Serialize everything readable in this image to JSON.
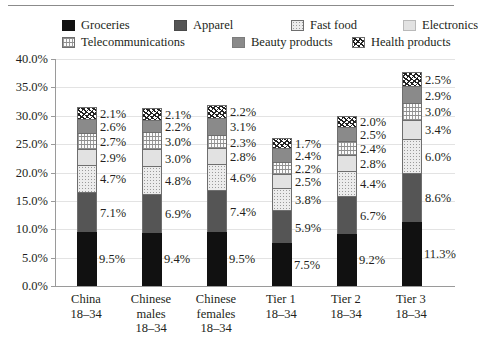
{
  "chart_data": {
    "type": "bar",
    "stacked": true,
    "title": "",
    "xlabel": "",
    "ylabel": "",
    "ylim": [
      0,
      40
    ],
    "ytick_labels": [
      "0.0%",
      "5.0%",
      "10.0%",
      "15.0%",
      "20.0%",
      "25.0%",
      "30.0%",
      "35.0%",
      "40.0%"
    ],
    "ytick_values": [
      0,
      5,
      10,
      15,
      20,
      25,
      30,
      35,
      40
    ],
    "grid": true,
    "legend_position": "top",
    "value_label_suffix": "%",
    "categories": [
      {
        "line1": "China",
        "line2": "18–34",
        "line3": ""
      },
      {
        "line1": "Chinese",
        "line2": "males",
        "line3": "18–34"
      },
      {
        "line1": "Chinese",
        "line2": "females",
        "line3": "18–34"
      },
      {
        "line1": "Tier 1",
        "line2": "18–34",
        "line3": ""
      },
      {
        "line1": "Tier 2",
        "line2": "18–34",
        "line3": ""
      },
      {
        "line1": "Tier 3",
        "line2": "18–34",
        "line3": ""
      }
    ],
    "series": [
      {
        "name": "Groceries",
        "swatch": "groceries",
        "values": [
          9.5,
          9.4,
          9.5,
          7.5,
          9.2,
          11.3
        ],
        "labels": [
          "9.5%",
          "9.4%",
          "9.5%",
          "7.5%",
          "9.2%",
          "11.3%"
        ]
      },
      {
        "name": "Apparel",
        "swatch": "apparel",
        "values": [
          7.1,
          6.9,
          7.4,
          5.9,
          6.7,
          8.6
        ],
        "labels": [
          "7.1%",
          "6.9%",
          "7.4%",
          "5.9%",
          "6.7%",
          "8.6%"
        ]
      },
      {
        "name": "Fast food",
        "swatch": "fastfood",
        "values": [
          4.7,
          4.8,
          4.6,
          3.8,
          4.4,
          6.0
        ],
        "labels": [
          "4.7%",
          "4.8%",
          "4.6%",
          "3.8%",
          "4.4%",
          "6.0%"
        ]
      },
      {
        "name": "Electronics",
        "swatch": "electronics",
        "values": [
          2.9,
          3.0,
          2.8,
          2.5,
          2.8,
          3.4
        ],
        "labels": [
          "2.9%",
          "3.0%",
          "2.8%",
          "2.5%",
          "2.8%",
          "3.4%"
        ]
      },
      {
        "name": "Telecommunications",
        "swatch": "telecom",
        "values": [
          2.7,
          3.0,
          2.3,
          2.2,
          2.4,
          3.0
        ],
        "labels": [
          "2.7%",
          "3.0%",
          "2.3%",
          "2.2%",
          "2.4%",
          "3.0%"
        ]
      },
      {
        "name": "Beauty products",
        "swatch": "beauty",
        "values": [
          2.6,
          2.2,
          3.1,
          2.4,
          2.5,
          2.9
        ],
        "labels": [
          "2.6%",
          "2.2%",
          "3.1%",
          "2.4%",
          "2.5%",
          "2.9%"
        ]
      },
      {
        "name": "Health products",
        "swatch": "health",
        "values": [
          2.1,
          2.1,
          2.2,
          1.7,
          2.0,
          2.5
        ],
        "labels": [
          "2.1%",
          "2.1%",
          "2.2%",
          "1.7%",
          "2.0%",
          "2.5%"
        ]
      }
    ]
  },
  "legend": {
    "rows": [
      [
        "Groceries",
        "Apparel",
        "Fast food",
        "Electronics"
      ],
      [
        "Telecommunications",
        "Beauty products",
        "Health products"
      ]
    ]
  },
  "colors": {
    "groceries": "#111111",
    "apparel": "#555555",
    "fast_food": "#ececec",
    "electronics": "#e2e2e2",
    "telecommunications": "#fbfbfb",
    "beauty_products": "#8a8a8a",
    "health_products": "#ffffff",
    "gridline": "#e3e3e3",
    "axis": "#9a9a9a",
    "text": "#231f20"
  }
}
